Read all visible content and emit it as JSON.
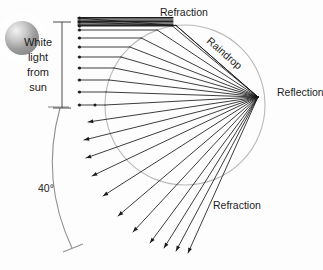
{
  "figure": {
    "background_color": "#fdfdfd",
    "ray_color": "#1a1a1a",
    "drop_color": "#b9b9b9",
    "arc_color": "#8f8f8f",
    "text_color": "#1c1c1c"
  },
  "labels": {
    "refraction_top": "Refraction",
    "raindrop": "Raindrop",
    "reflection": "Reflection",
    "refraction_bottom": "Refraction",
    "angle": "40°",
    "white_light_line1": "White",
    "white_light_line2": "light",
    "white_light_line3": "from",
    "white_light_line4": "sun"
  },
  "chart_data": {
    "type": "scatter",
    "title": "",
    "xlabel": "",
    "ylabel": "",
    "drop": {
      "cx": 185,
      "cy": 105,
      "r": 80
    },
    "sun": {
      "cx": 22,
      "cy": 38,
      "r": 17
    },
    "incoming_ray_start_x": 78,
    "incoming_ray_y": [
      18,
      22,
      26,
      30,
      38,
      47,
      57,
      68,
      80,
      92,
      105
    ],
    "reflection_point": {
      "x": 258,
      "y": 97
    },
    "angle_arc": {
      "label": "40°",
      "label_x": 50,
      "label_y": 193,
      "start": {
        "x": 60,
        "y": 108
      },
      "end": {
        "x": 72,
        "y": 248
      }
    },
    "bracket": {
      "x": 62,
      "y_top": 22,
      "y_bottom": 108
    },
    "exit_fan_end": [
      {
        "x": 88,
        "y": 122
      },
      {
        "x": 84,
        "y": 140
      },
      {
        "x": 86,
        "y": 158
      },
      {
        "x": 92,
        "y": 176
      },
      {
        "x": 103,
        "y": 196
      },
      {
        "x": 118,
        "y": 216
      },
      {
        "x": 133,
        "y": 232
      },
      {
        "x": 150,
        "y": 243
      },
      {
        "x": 164,
        "y": 248
      },
      {
        "x": 176,
        "y": 251
      },
      {
        "x": 188,
        "y": 253
      }
    ]
  }
}
